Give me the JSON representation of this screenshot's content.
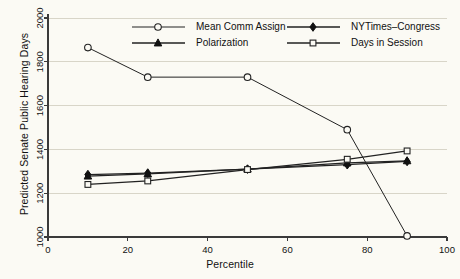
{
  "chart_data": {
    "type": "line",
    "title": "",
    "xlabel": "Percentile",
    "ylabel": "Predicted Senate Public Hearing Days",
    "xlim": [
      0,
      100
    ],
    "ylim": [
      1000,
      2000
    ],
    "xticks": [
      0,
      20,
      40,
      60,
      80,
      100
    ],
    "yticks": [
      1000,
      1200,
      1400,
      1600,
      1800,
      2000
    ],
    "grid": true,
    "grid_axis": "y",
    "legend_position": "top-inside",
    "x": [
      10,
      25,
      50,
      75,
      90
    ],
    "series": [
      {
        "name": "Mean Comm Assign",
        "marker": "open-circle",
        "values": [
          1865,
          1730,
          1730,
          1490,
          1005
        ]
      },
      {
        "name": "NYTimes-Congress",
        "marker": "filled-diamond",
        "values": [
          1285,
          1292,
          1310,
          1330,
          1345
        ]
      },
      {
        "name": "Polarization",
        "marker": "filled-triangle",
        "values": [
          1278,
          1288,
          1310,
          1338,
          1348
        ]
      },
      {
        "name": "Days in Session",
        "marker": "open-square",
        "values": [
          1240,
          1256,
          1308,
          1355,
          1393
        ]
      }
    ]
  },
  "legend": {
    "entries": [
      {
        "label": "Mean Comm Assign",
        "marker": "open-circle"
      },
      {
        "label": "NYTimes–Congress",
        "marker": "filled-diamond"
      },
      {
        "label": "Polarization",
        "marker": "filled-triangle"
      },
      {
        "label": "Days in Session",
        "marker": "open-square"
      }
    ]
  },
  "axes": {
    "x_tick_labels": [
      "0",
      "20",
      "40",
      "60",
      "80",
      "100"
    ],
    "y_tick_labels": [
      "1000",
      "1200",
      "1400",
      "1600",
      "1800",
      "2000"
    ]
  }
}
